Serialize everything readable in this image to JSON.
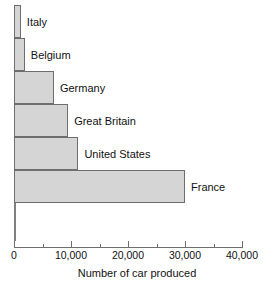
{
  "chart_data": {
    "type": "bar",
    "orientation": "horizontal",
    "title": "",
    "xlabel": "Number of car produced",
    "ylabel": "",
    "categories": [
      "Italy",
      "Belgium",
      "Germany",
      "Great Britain",
      "United States",
      "France"
    ],
    "values": [
      1200,
      1900,
      7000,
      9500,
      11300,
      30000
    ],
    "xlim": [
      0,
      40000
    ],
    "ylim": null,
    "grid": false,
    "legend": null,
    "x_ticks": [
      {
        "value": 0,
        "label": "0",
        "type": "major"
      },
      {
        "value": 5000,
        "label": "",
        "type": "minor"
      },
      {
        "value": 10000,
        "label": "10,000",
        "type": "major"
      },
      {
        "value": 15000,
        "label": "",
        "type": "minor"
      },
      {
        "value": 20000,
        "label": "20,000",
        "type": "major"
      },
      {
        "value": 25000,
        "label": "",
        "type": "minor"
      },
      {
        "value": 30000,
        "label": "30,000",
        "type": "major"
      },
      {
        "value": 35000,
        "label": "",
        "type": "minor"
      },
      {
        "value": 40000,
        "label": "40,000",
        "type": "major"
      }
    ],
    "colors": {
      "bar_fill": "#d5d5d5",
      "bar_border": "#6e6e6e",
      "axis": "#6e6e6e",
      "text": "#111111",
      "background": "#ffffff"
    }
  }
}
